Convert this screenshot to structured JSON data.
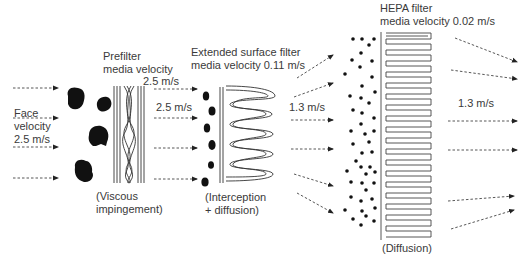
{
  "labels": {
    "face_velocity": [
      "Face",
      "velocity",
      "2.5 m/s"
    ],
    "prefilter_title": [
      "Prefilter",
      "media velocity"
    ],
    "prefilter_velocity": "2.5 m/s",
    "prefilter_mid_velocity": "2.5 m/s",
    "prefilter_mechanism": [
      "(Viscous",
      "impingement)"
    ],
    "extended_title": [
      "Extended surface filter",
      "media velocity 0.11 m/s"
    ],
    "extended_mechanism": [
      "(Interception",
      "+ diffusion)"
    ],
    "mid_velocity": "1.3 m/s",
    "hepa_title": [
      "HEPA filter",
      "media velocity 0.02 m/s"
    ],
    "hepa_mechanism": "(Diffusion)",
    "out_velocity": "1.3 m/s"
  },
  "colors": {
    "ink": "#1a1a1a",
    "text": "#3a3a3a",
    "line": "#444444"
  }
}
